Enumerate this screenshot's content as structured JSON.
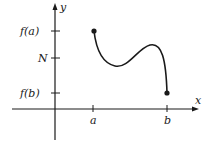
{
  "diagram": {
    "type": "function-graph",
    "axes": {
      "x_label": "x",
      "y_label": "y"
    },
    "y_ticks": [
      {
        "label": "f(a)",
        "y": 31
      },
      {
        "label": "N",
        "y": 58
      },
      {
        "label": "f(b)",
        "y": 93
      }
    ],
    "x_ticks": [
      {
        "label": "a",
        "x": 93
      },
      {
        "label": "b",
        "x": 167
      }
    ],
    "curve": {
      "start": {
        "x": 94,
        "y": 31
      },
      "end": {
        "x": 167,
        "y": 93
      },
      "color": "#1a1a1a"
    }
  }
}
